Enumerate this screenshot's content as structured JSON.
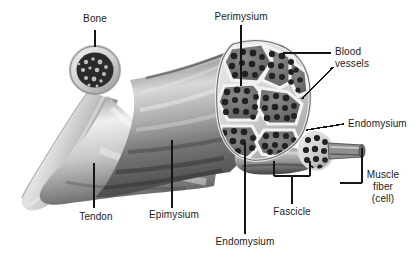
{
  "figure": {
    "background_color": "#ffffff",
    "text_color": "#1b1b1b",
    "leader_color": "#151515",
    "width": 418,
    "height": 262
  },
  "labels": {
    "bone": "Bone",
    "perimysium": "Perimysium",
    "blood_vessels_line1": "Blood",
    "blood_vessels_line2": "vessels",
    "endomysium_right": "Endomysium",
    "muscle_fiber_line1": "Muscle",
    "muscle_fiber_line2": "fiber",
    "muscle_fiber_line3": "(cell)",
    "fascicle": "Fascicle",
    "endomysium_bottom": "Endomysium",
    "epimysium": "Epimysium",
    "tendon": "Tendon"
  },
  "structures": {
    "bone_shaft": "bone-shaft",
    "bone_marrow_cross_section": "bone-marrow-cross-section",
    "tendon_body": "tendon-body",
    "muscle_belly": "muscle-belly",
    "muscle_cross_section": "muscle-cross-section",
    "fascicle_bundle": "fascicle-bundle",
    "single_fascicle": "single-fascicle",
    "single_muscle_fiber": "single-muscle-fiber"
  },
  "leaders": {
    "bone": "vertical line from Bone label down to bone cross-section",
    "perimysium": "vertical line from Perimysium label down into fascicle wall",
    "blood_vessels": "horizontal line plus diagonal line to cross-section edge",
    "endomysium_right": "horizontal line to small fascicle",
    "muscle_fiber": "horizontal line and elbow up to muscle fiber tip",
    "fascicle": "bracket under cross-section with drop line",
    "endomysium_bottom": "vertical line up into fascicle interior",
    "epimysium": "vertical line up to muscle sheath",
    "tendon": "vertical line up to tendon body"
  }
}
